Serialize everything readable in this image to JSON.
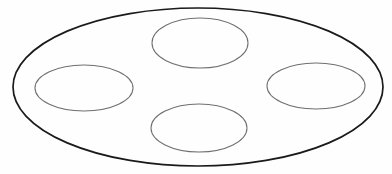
{
  "figure": {
    "background_color": "#fefefe",
    "width": 392,
    "height": 174
  },
  "diagram": {
    "type": "line-drawing",
    "shapes": [
      {
        "id": "outer-ellipse",
        "name": "outer-ellipse",
        "role": "container-boundary",
        "position": "enclosing",
        "cx": 198,
        "cy": 87,
        "rx": 185,
        "ry": 79,
        "stroke_color": "#1a1a1a",
        "stroke_width": 1.7,
        "fill": "none"
      },
      {
        "id": "top-ellipse",
        "name": "top-inner-ellipse",
        "role": "inner-oval",
        "position": "top",
        "cx": 200,
        "cy": 43,
        "rx": 48,
        "ry": 25,
        "stroke_color": "#6f6f6f",
        "stroke_width": 1.05,
        "fill": "none"
      },
      {
        "id": "left-ellipse",
        "name": "left-inner-ellipse",
        "role": "inner-oval",
        "position": "left",
        "cx": 84,
        "cy": 88,
        "rx": 49,
        "ry": 23,
        "stroke_color": "#6f6f6f",
        "stroke_width": 1.05,
        "fill": "none"
      },
      {
        "id": "right-ellipse",
        "name": "right-inner-ellipse",
        "role": "inner-oval",
        "position": "right",
        "cx": 316,
        "cy": 86,
        "rx": 49,
        "ry": 23,
        "stroke_color": "#6f6f6f",
        "stroke_width": 1.05,
        "fill": "none"
      },
      {
        "id": "bottom-ellipse",
        "name": "bottom-inner-ellipse",
        "role": "inner-oval",
        "position": "bottom",
        "cx": 199,
        "cy": 128,
        "rx": 48,
        "ry": 24,
        "stroke_color": "#6f6f6f",
        "stroke_width": 1.05,
        "fill": "none"
      }
    ],
    "counts": {
      "outer_shapes": 1,
      "inner_shapes": 4,
      "total_shapes": 5
    }
  }
}
